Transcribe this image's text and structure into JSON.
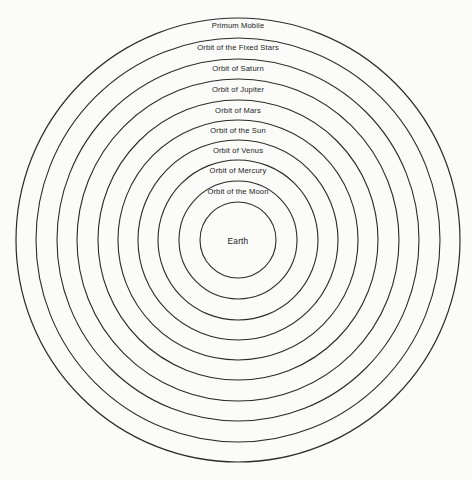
{
  "diagram": {
    "background_color": "#fbfbf9",
    "line_color": "#2b2b2b",
    "text_color": "#1a1a1a",
    "center": {
      "x": 238,
      "y": 240
    },
    "spheres": [
      {
        "id": "primum-mobile",
        "label": "Primum Mobile",
        "radius": 222,
        "label_y": 28
      },
      {
        "id": "fixed-stars",
        "label": "Orbit of the Fixed Stars",
        "radius": 202,
        "label_y": 50
      },
      {
        "id": "saturn",
        "label": "Orbit of Saturn",
        "radius": 181,
        "label_y": 71
      },
      {
        "id": "jupiter",
        "label": "Orbit of Jupiter",
        "radius": 161,
        "label_y": 92
      },
      {
        "id": "mars",
        "label": "Orbit of Mars",
        "radius": 140,
        "label_y": 113
      },
      {
        "id": "sun",
        "label": "Orbit of the Sun",
        "radius": 120,
        "label_y": 133
      },
      {
        "id": "venus",
        "label": "Orbit of Venus",
        "radius": 100,
        "label_y": 153
      },
      {
        "id": "mercury",
        "label": "Orbit of Mercury",
        "radius": 80,
        "label_y": 173
      },
      {
        "id": "moon",
        "label": "Orbit of the Moon",
        "radius": 59,
        "label_y": 194
      },
      {
        "id": "earth",
        "label": "Earth",
        "radius": 38,
        "label_y": 244
      }
    ]
  }
}
